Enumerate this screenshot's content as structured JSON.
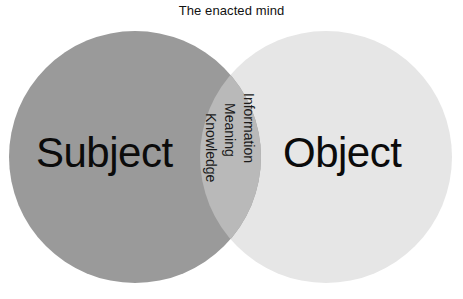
{
  "title": "The enacted mind",
  "diagram": {
    "type": "venn-2-set",
    "left_set": {
      "label": "Subject",
      "fill": "#9a9a9a"
    },
    "right_set": {
      "label": "Object",
      "fill": "#e6e6e6"
    },
    "intersection": {
      "fill": "#b9b9b9",
      "labels": [
        "Knowledge",
        "Meaning",
        "Information"
      ],
      "label_orientation": "vertical-rotated-90-clockwise"
    },
    "background": "#ffffff",
    "text_color": "#0b0b0b"
  }
}
